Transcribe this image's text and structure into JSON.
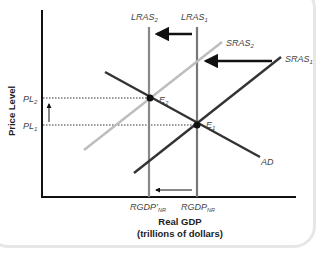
{
  "diagram": {
    "y_axis_label": "Price Level",
    "x_axis_label_line1": "Real GDP",
    "x_axis_label_line2": "(trillions of dollars)",
    "curves": {
      "lras2": {
        "label": "LRAS",
        "sub": "2"
      },
      "lras1": {
        "label": "LRAS",
        "sub": "1"
      },
      "sras2": {
        "label": "SRAS",
        "sub": "2"
      },
      "sras1": {
        "label": "SRAS",
        "sub": "1"
      },
      "ad": {
        "label": "AD"
      }
    },
    "points": {
      "e2": {
        "label": "E",
        "sub": "2"
      },
      "e1": {
        "label": "E",
        "sub": "1"
      }
    },
    "y_ticks": {
      "pl2": {
        "label": "PL",
        "sub": "2"
      },
      "pl1": {
        "label": "PL",
        "sub": "1"
      }
    },
    "x_ticks": {
      "rgdp_nr_prime": {
        "label": "RGDP’",
        "sub": "NR"
      },
      "rgdp_nr": {
        "label": "RGDP",
        "sub": "NR"
      }
    },
    "colors": {
      "axis": "#111111",
      "lras": "#888888",
      "sras2": "#bdbdbd",
      "sras1_ad": "#333333",
      "arrow": "#111111"
    }
  }
}
